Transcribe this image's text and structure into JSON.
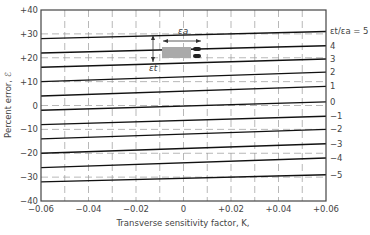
{
  "chart_data": {
    "type": "line",
    "title": "",
    "xlabel": "Transverse sensitivity factor, K,",
    "ylabel": "Percent error, ℰ",
    "xlim": [
      -0.06,
      0.06
    ],
    "ylim": [
      -40,
      40
    ],
    "x_ticks": [
      "-0.06",
      "-0.04",
      "-0.02",
      "0",
      "+0.02",
      "+0.04",
      "+0.06"
    ],
    "y_ticks": [
      "+40",
      "+30",
      "+20",
      "+10",
      "0",
      "-10",
      "-20",
      "-30",
      "-40"
    ],
    "grid": "dashed",
    "legend_title": "εt/εa = ",
    "series": [
      {
        "name": "5",
        "x": [
          -0.06,
          0.06
        ],
        "values": [
          28,
          31
        ]
      },
      {
        "name": "4",
        "x": [
          -0.06,
          0.06
        ],
        "values": [
          22,
          25
        ]
      },
      {
        "name": "3",
        "x": [
          -0.06,
          0.06
        ],
        "values": [
          16,
          19.5
        ]
      },
      {
        "name": "2",
        "x": [
          -0.06,
          0.06
        ],
        "values": [
          10,
          14
        ]
      },
      {
        "name": "1",
        "x": [
          -0.06,
          0.06
        ],
        "values": [
          4,
          8
        ]
      },
      {
        "name": "0",
        "x": [
          -0.06,
          0.06
        ],
        "values": [
          -2,
          1.5
        ]
      },
      {
        "name": "-1",
        "x": [
          -0.06,
          0.06
        ],
        "values": [
          -8,
          -4.5
        ]
      },
      {
        "name": "-2",
        "x": [
          -0.06,
          0.06
        ],
        "values": [
          -14,
          -10
        ]
      },
      {
        "name": "-3",
        "x": [
          -0.06,
          0.06
        ],
        "values": [
          -20,
          -16
        ]
      },
      {
        "name": "-4",
        "x": [
          -0.06,
          0.06
        ],
        "values": [
          -26,
          -22
        ]
      },
      {
        "name": "-5",
        "x": [
          -0.06,
          0.06
        ],
        "values": [
          -32,
          -29
        ]
      }
    ],
    "inset": {
      "axial_label": "εa",
      "transverse_label": "εt"
    }
  }
}
